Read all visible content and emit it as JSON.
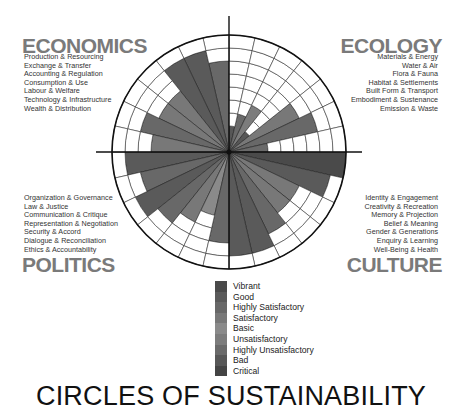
{
  "title": "CIRCLES OF SUSTAINABILITY",
  "domains": {
    "economics": {
      "title": "ECONOMICS",
      "items": [
        "Production & Resourcing",
        "Exchange & Transfer",
        "Accounting & Regulation",
        "Consumption & Use",
        "Labour & Welfare",
        "Technology & Infrastructure",
        "Wealth & Distribution"
      ]
    },
    "ecology": {
      "title": "ECOLOGY",
      "items": [
        "Materials & Energy",
        "Water & Air",
        "Flora & Fauna",
        "Habitat & Settlements",
        "Built Form & Transport",
        "Embodiment & Sustenance",
        "Emission & Waste"
      ]
    },
    "politics": {
      "title": "POLITICS",
      "items": [
        "Organization & Governance",
        "Law & Justice",
        "Communication & Critique",
        "Representation & Negotiation",
        "Security & Accord",
        "Dialogue & Reconciliation",
        "Ethics & Accountability"
      ]
    },
    "culture": {
      "title": "CULTURE",
      "items": [
        "Identity & Engagement",
        "Creativity & Recreation",
        "Memory & Projection",
        "Belief & Meaning",
        "Gender & Generations",
        "Enquiry & Learning",
        "Well-Being & Health"
      ]
    }
  },
  "legend": [
    {
      "label": "Vibrant",
      "color": "#4a4a4a"
    },
    {
      "label": "Good",
      "color": "#5a5a5a"
    },
    {
      "label": "Highly Satisfactory",
      "color": "#686868"
    },
    {
      "label": "Satisfactory",
      "color": "#787878"
    },
    {
      "label": "Basic",
      "color": "#8a8a8a"
    },
    {
      "label": "Unsatisfactory",
      "color": "#7c7c7c"
    },
    {
      "label": "Highly Unsatisfactory",
      "color": "#6a6a6a"
    },
    {
      "label": "Bad",
      "color": "#575757"
    },
    {
      "label": "Critical",
      "color": "#444444"
    }
  ],
  "chart_data": {
    "type": "polar-bar",
    "title": "CIRCLES OF SUSTAINABILITY",
    "levels": 9,
    "scale_labels": [
      "Critical",
      "Bad",
      "Highly Unsatisfactory",
      "Unsatisfactory",
      "Basic",
      "Satisfactory",
      "Highly Satisfactory",
      "Good",
      "Vibrant"
    ],
    "center": [
      229,
      152
    ],
    "radius": 117,
    "series": [
      {
        "name": "Economics",
        "quadrant": "top-left",
        "categories": [
          "Production & Resourcing",
          "Exchange & Transfer",
          "Accounting & Regulation",
          "Consumption & Use",
          "Labour & Welfare",
          "Technology & Infrastructure",
          "Wealth & Distribution"
        ],
        "values": [
          7,
          8,
          8,
          6,
          6,
          7,
          6
        ],
        "color": "#6e6e6e"
      },
      {
        "name": "Ecology",
        "quadrant": "top-right",
        "categories": [
          "Materials & Energy",
          "Water & Air",
          "Flora & Fauna",
          "Habitat & Settlements",
          "Built Form & Transport",
          "Embodiment & Sustenance",
          "Emission & Waste"
        ],
        "values": [
          2,
          3,
          4,
          2,
          6,
          7,
          3
        ],
        "color": "#6e6e6e"
      },
      {
        "name": "Culture",
        "quadrant": "bottom-right",
        "categories": [
          "Identity & Engagement",
          "Creativity & Recreation",
          "Memory & Projection",
          "Belief & Meaning",
          "Gender & Generations",
          "Enquiry & Learning",
          "Well-Being & Health"
        ],
        "values": [
          9,
          8,
          6,
          6,
          7,
          8,
          8
        ],
        "color": "#6e6e6e"
      },
      {
        "name": "Politics",
        "quadrant": "bottom-left",
        "categories": [
          "Organization & Governance",
          "Law & Justice",
          "Communication & Critique",
          "Representation & Negotiation",
          "Security & Accord",
          "Dialogue & Reconciliation",
          "Ethics & Accountability"
        ],
        "values": [
          8,
          7,
          8,
          7,
          6,
          5,
          7
        ],
        "color": "#6e6e6e"
      }
    ],
    "level_colors": [
      "#444444",
      "#575757",
      "#6a6a6a",
      "#7c7c7c",
      "#8a8a8a",
      "#787878",
      "#686868",
      "#5a5a5a",
      "#4a4a4a"
    ]
  }
}
